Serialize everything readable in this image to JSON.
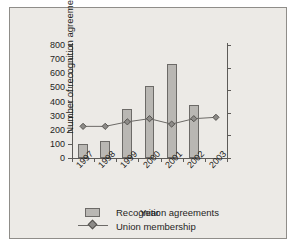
{
  "chart_data": {
    "type": "bar",
    "title": "",
    "subtitle": "",
    "xlabel": "Year",
    "ylabel": "Number of recognition agreements",
    "y2label": "Union membership (millions)",
    "categories": [
      "1997",
      "1998",
      "1999",
      "2000",
      "2001",
      "2002",
      "2003"
    ],
    "ylim": [
      0,
      800
    ],
    "yticks": [
      "0",
      "100",
      "200",
      "300",
      "400",
      "500",
      "600",
      "700",
      "800"
    ],
    "ytick_values": [
      0,
      100,
      200,
      300,
      400,
      500,
      600,
      700,
      800
    ],
    "y2lim": [
      6.5,
      9
    ],
    "y2ticks": [
      "6.5",
      "7",
      "7.5",
      "8",
      "8.5",
      "9"
    ],
    "y2tick_values": [
      6.5,
      7,
      7.5,
      8,
      8.5,
      9
    ],
    "grid": false,
    "legend_position": "bottom",
    "series": [
      {
        "name": "Recognition agreements",
        "type": "bar",
        "axis": "left",
        "color": "#b9b7b3",
        "edge_color": "#6c6a67",
        "values": [
          100,
          120,
          350,
          510,
          665,
          375,
          null
        ]
      },
      {
        "name": "Union membership",
        "type": "line",
        "axis": "right",
        "color": "#6c6a67",
        "marker": "diamond",
        "values": [
          7.2,
          7.2,
          7.3,
          7.37,
          7.25,
          7.37,
          7.4
        ]
      }
    ]
  },
  "legend": {
    "items": [
      {
        "label": "Recognition agreements",
        "key": "bar-swatch"
      },
      {
        "label": "Union membership",
        "key": "line-marker"
      }
    ]
  },
  "colors": {
    "figure_background": "#eceae6",
    "page_background": "#ffffff",
    "frame_border": "#8f8d89",
    "axis": "#5d5b58",
    "bar_fill": "#b9b7b3",
    "bar_edge": "#6c6a67",
    "line": "#6c6a67",
    "marker_fill": "#8d8b88",
    "text": "#1f1e1d"
  }
}
